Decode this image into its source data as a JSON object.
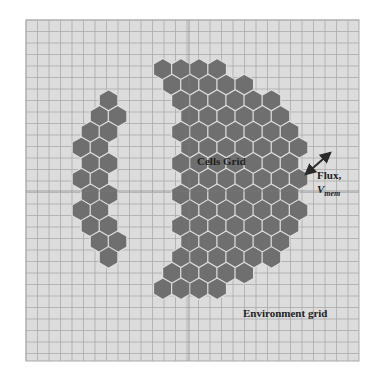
{
  "figure": {
    "labels": {
      "cells_grid": "Cells Grid",
      "environment_grid": "Environment grid",
      "flux_line1": "Flux,",
      "flux_v": "V",
      "flux_sub": "mem"
    },
    "colors": {
      "page_background": "#ffffff",
      "grid_background": "#dcdcdc",
      "grid_line": "#a9a9a9",
      "crosshair_line": "#7a7a7a",
      "cell_fill": "#6f6f6f",
      "cell_border": "#dedede",
      "arrow": "#2a2a2a"
    },
    "grid": {
      "left": 26,
      "top": 20,
      "right": 359,
      "bottom": 361,
      "cell_size": 11.5,
      "crosshair_x": 189,
      "crosshair_y": 191
    },
    "cell_mass": {
      "center_x": 190,
      "center_y": 179,
      "radius_x": 120,
      "radius_y": 117,
      "hex_size": 11
    },
    "flux_arrow": {
      "x1": 306,
      "y1": 174,
      "x2": 330,
      "y2": 153,
      "direction": "bidirectional"
    }
  }
}
